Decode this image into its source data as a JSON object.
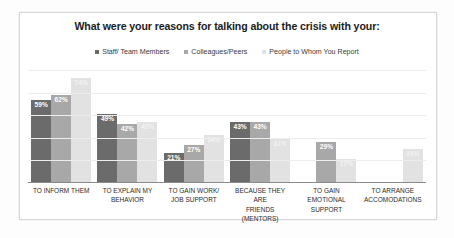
{
  "chart_data": {
    "type": "bar",
    "title": "What were your reasons for talking about the crisis with your:",
    "xlabel": "",
    "ylabel": "",
    "ylim": [
      0,
      80
    ],
    "grid": true,
    "legend_position": "top-center",
    "categories": [
      "TO INFORM THEM",
      "TO EXPLAIN MY BEHAVIOR",
      "TO GAIN WORK/ JOB SUPPORT",
      "BECAUSE THEY ARE FRIENDS (MENTORS)",
      "TO GAIN EMOTIONAL SUPPORT",
      "TO ARRANGE ACCOMODATIONS"
    ],
    "category_lines": [
      [
        "TO INFORM THEM"
      ],
      [
        "TO EXPLAIN MY",
        "BEHAVIOR"
      ],
      [
        "TO GAIN WORK/",
        "JOB SUPPORT"
      ],
      [
        "BECAUSE THEY ARE",
        "FRIENDS",
        "(MENTORS)"
      ],
      [
        "TO GAIN",
        "EMOTIONAL",
        "SUPPORT"
      ],
      [
        "TO ARRANGE",
        "ACCOMODATIONS"
      ]
    ],
    "series": [
      {
        "name": "Staff/ Team Members",
        "color": "#6b6b6b",
        "values": [
          59,
          49,
          21,
          43,
          null,
          null
        ],
        "labels": [
          "59%",
          "49%",
          "21%",
          "43%",
          "",
          ""
        ]
      },
      {
        "name": "Colleagues/Peers",
        "color": "#a8a8a8",
        "values": [
          62,
          42,
          27,
          43,
          29,
          null
        ],
        "labels": [
          "62%",
          "42%",
          "27%",
          "43%",
          "29%",
          ""
        ]
      },
      {
        "name": "People to Whom You Report",
        "color": "#e2e2e2",
        "values": [
          74,
          43,
          34,
          31,
          17,
          24
        ],
        "labels": [
          "74%",
          "43%",
          "34%",
          "31%",
          "17%",
          "24%"
        ]
      }
    ],
    "gridline_values": [
      0,
      16,
      32,
      48,
      64,
      80
    ]
  },
  "legend": {
    "items": [
      {
        "label": "Staff/ Team Members",
        "color": "#6b6b6b"
      },
      {
        "label": "Colleagues/Peers",
        "color": "#a8a8a8"
      },
      {
        "label": "People to Whom You Report",
        "color": "#e2e2e2"
      }
    ]
  }
}
